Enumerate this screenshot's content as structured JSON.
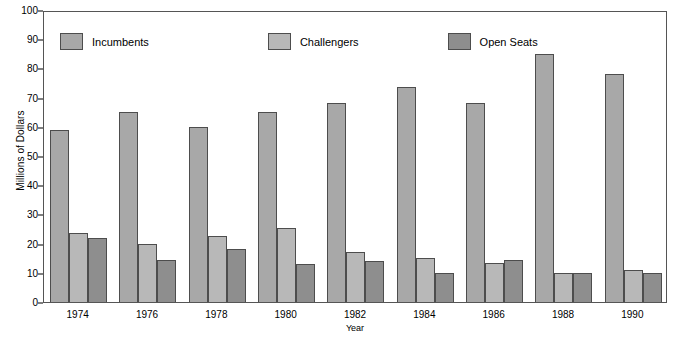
{
  "chart_data": {
    "type": "bar",
    "title": "",
    "xlabel": "Year",
    "ylabel": "Millions of Dollars",
    "categories": [
      "1974",
      "1976",
      "1978",
      "1980",
      "1982",
      "1984",
      "1986",
      "1988",
      "1990"
    ],
    "series": [
      {
        "name": "Incumbents",
        "color": "#a8a8a8",
        "values": [
          59,
          65,
          60,
          65,
          68,
          73.5,
          68,
          85,
          78
        ]
      },
      {
        "name": "Challengers",
        "color": "#b8b8b8",
        "values": [
          23.5,
          20,
          22.5,
          25.5,
          17,
          15,
          13.5,
          10,
          11
        ]
      },
      {
        "name": "Open Seats",
        "color": "#8e8e8e",
        "values": [
          22,
          14.5,
          18,
          13,
          14,
          10,
          14.5,
          10,
          10
        ]
      }
    ],
    "ylim": [
      0,
      100
    ],
    "y_ticks": [
      "0",
      "10",
      "20",
      "30",
      "40",
      "50",
      "60",
      "70",
      "80",
      "90",
      "100"
    ],
    "y_tick_values": [
      0,
      10,
      20,
      30,
      40,
      50,
      60,
      70,
      80,
      90,
      100
    ],
    "grid": false,
    "legend_position": "top-left-inside",
    "legend": [
      "Incumbents",
      "Challengers",
      "Open Seats"
    ]
  },
  "axes": {
    "y_title": "Millions of Dollars",
    "x_title": "Year"
  },
  "legend": {
    "items": [
      {
        "label": "Incumbents"
      },
      {
        "label": "Challengers"
      },
      {
        "label": "Open Seats"
      }
    ]
  }
}
